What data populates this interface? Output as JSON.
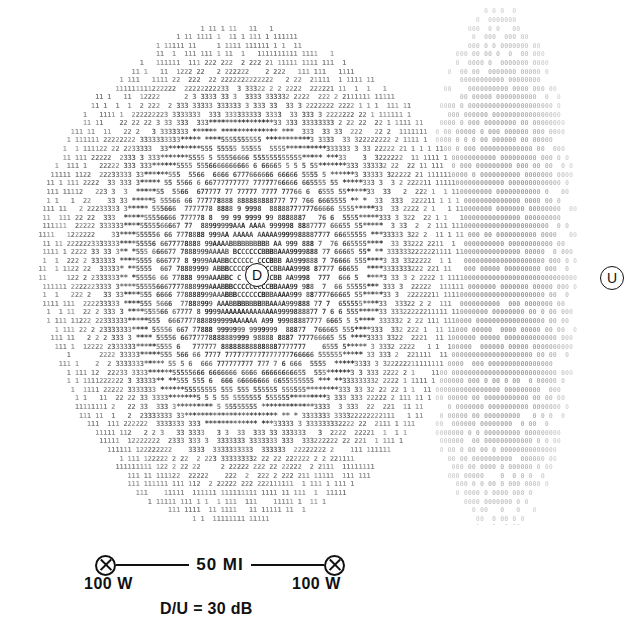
{
  "figure": {
    "kind": "ascii-contour-plot"
  },
  "overlay": {
    "desired_marker": "D",
    "undesired_marker": "U"
  },
  "legend": {
    "distance": "50 MI",
    "power_left": "100 W",
    "power_right": "100 W",
    "ratio": "D/U = 30 dB",
    "transmitter_symbol": "transmitter-circle-x-icon"
  },
  "colors": {
    "ink": "#141414",
    "paper": "#ffffff"
  },
  "chart_data": {
    "type": "heatmap",
    "title": "",
    "xlabel": "",
    "ylabel": "",
    "render": "character-cell-contour",
    "cell_width": 4.05,
    "cell_height": 8.6,
    "grid_cols": 158,
    "grid_rows": 61,
    "origin_x": 2,
    "origin_y": 6,
    "note": "Each contour band is printed as a repeated character; level order from outermost/weakest to innermost/strongest.",
    "levels": [
      {
        "char": "0",
        "name": "undesired-lobe",
        "weight": 0.42,
        "size": 0.78
      },
      {
        "char": "1",
        "name": "level-1",
        "weight": 0.52,
        "size": 0.8
      },
      {
        "char": "2",
        "name": "level-2",
        "weight": 0.58,
        "size": 0.8
      },
      {
        "char": "3",
        "name": "level-3",
        "weight": 0.66,
        "size": 0.82
      },
      {
        "char": "*",
        "name": "level-4-asterisk",
        "weight": 0.88,
        "size": 0.92
      },
      {
        "char": "5",
        "name": "level-5",
        "weight": 0.7,
        "size": 0.82
      },
      {
        "char": "6",
        "name": "level-6",
        "weight": 0.74,
        "size": 0.82
      },
      {
        "char": "7",
        "name": "level-7",
        "weight": 0.76,
        "size": 0.82
      },
      {
        "char": "8",
        "name": "level-8",
        "weight": 0.86,
        "size": 0.84
      },
      {
        "char": "9",
        "name": "level-9",
        "weight": 0.86,
        "size": 0.84
      },
      {
        "char": "A",
        "name": "level-A",
        "weight": 0.88,
        "size": 0.84
      },
      {
        "char": "B",
        "name": "level-B",
        "weight": 0.9,
        "size": 0.84
      },
      {
        "char": "C",
        "name": "level-C",
        "weight": 0.9,
        "size": 0.84
      }
    ],
    "desired_contour": {
      "center_x": 250,
      "center_y": 272,
      "radius_x": 205,
      "radius_y": 258,
      "bands": [
        {
          "char": "1",
          "r_outer": 1.0,
          "r_inner": 0.86
        },
        {
          "char": "2",
          "r_outer": 0.86,
          "r_inner": 0.745
        },
        {
          "char": "3",
          "r_outer": 0.745,
          "r_inner": 0.625
        },
        {
          "char": "*",
          "r_outer": 0.625,
          "r_inner": 0.545
        },
        {
          "char": "5",
          "r_outer": 0.545,
          "r_inner": 0.465
        },
        {
          "char": "6",
          "r_outer": 0.465,
          "r_inner": 0.395
        },
        {
          "char": "7",
          "r_outer": 0.395,
          "r_inner": 0.325
        },
        {
          "char": "8",
          "r_outer": 0.325,
          "r_inner": 0.265
        },
        {
          "char": "9",
          "r_outer": 0.265,
          "r_inner": 0.205
        },
        {
          "char": "A",
          "r_outer": 0.205,
          "r_inner": 0.15
        },
        {
          "char": "B",
          "r_outer": 0.15,
          "r_inner": 0.105
        },
        {
          "char": "C",
          "r_outer": 0.105,
          "r_inner": 0.0
        }
      ]
    },
    "undesired_field": {
      "char": "0",
      "center_x": 500,
      "center_y": 272,
      "radius_x": 78,
      "radius_y": 268,
      "note": "Dense column of zeros along the right side marking the undesired-station service area"
    }
  }
}
